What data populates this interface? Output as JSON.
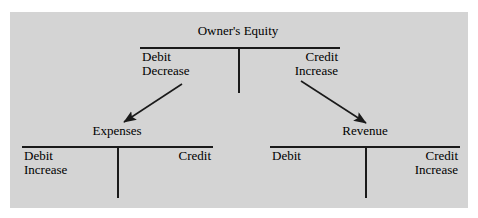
{
  "diagram": {
    "background_color": "#d4d4d4",
    "line_color": "#1a1a1a",
    "text_color": "#000000",
    "accounts": {
      "owners_equity": {
        "name": "Owner's Equity",
        "debit_label": "Debit",
        "debit_effect": "Decrease",
        "credit_label": "Credit",
        "credit_effect": "Increase"
      },
      "expenses": {
        "name": "Expenses",
        "debit_label": "Debit",
        "debit_effect": "Increase",
        "credit_label": "Credit",
        "credit_effect": ""
      },
      "revenue": {
        "name": "Revenue",
        "debit_label": "Debit",
        "debit_effect": "",
        "credit_label": "Credit",
        "credit_effect": "Increase"
      }
    },
    "arrows": [
      {
        "name": "owners-equity-to-expenses",
        "from": "Owner's Equity Debit Decrease",
        "to": "Expenses"
      },
      {
        "name": "owners-equity-to-revenue",
        "from": "Owner's Equity Credit Increase",
        "to": "Revenue"
      }
    ]
  }
}
